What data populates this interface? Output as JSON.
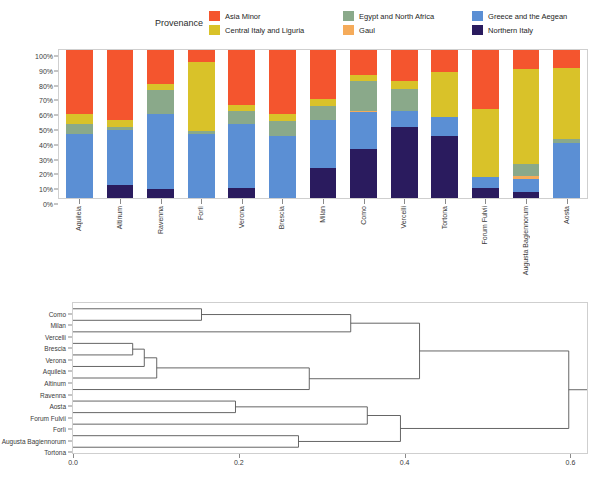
{
  "legend": {
    "title": "Provenance",
    "columns": [
      [
        {
          "label": "Asia Minor",
          "color": "#f4552e"
        },
        {
          "label": "Central Italy and Liguria",
          "color": "#d9c229"
        }
      ],
      [
        {
          "label": "Egypt and North Africa",
          "color": "#8aa98a"
        },
        {
          "label": "Gaul",
          "color": "#f5ab5a"
        }
      ],
      [
        {
          "label": "Greece and the Aegean",
          "color": "#5b8fd4"
        },
        {
          "label": "Northern Italy",
          "color": "#2a1b5e"
        }
      ]
    ]
  },
  "chart_data": [
    {
      "type": "bar",
      "subtype": "stacked-percentage",
      "title": "",
      "xlabel": "",
      "ylabel": "",
      "ylim": [
        0,
        100
      ],
      "ytick_labels": [
        "0%",
        "10%",
        "20%",
        "30%",
        "40%",
        "50%",
        "60%",
        "70%",
        "80%",
        "90%",
        "100%"
      ],
      "ytick_values": [
        0,
        10,
        20,
        30,
        40,
        50,
        60,
        70,
        80,
        90,
        100
      ],
      "grid": false,
      "legend_position": "top",
      "categories": [
        "Aquileia",
        "Altinum",
        "Ravenna",
        "Forlì",
        "Verona",
        "Brescia",
        "Milan",
        "Como",
        "Vercelli",
        "Tortona",
        "Forum Fulvii",
        "Augusta Bagiennorum",
        "Aosta"
      ],
      "series": [
        {
          "name": "Northern Italy",
          "color": "#2a1b5e",
          "values": [
            0,
            9,
            6,
            0,
            7,
            0,
            20,
            33,
            48,
            42,
            7,
            4,
            0
          ]
        },
        {
          "name": "Greece and the Aegean",
          "color": "#5b8fd4",
          "values": [
            43,
            37,
            51,
            43,
            43,
            42,
            33,
            25,
            11,
            13,
            7,
            9,
            37
          ]
        },
        {
          "name": "Gaul",
          "color": "#f5ab5a",
          "values": [
            0,
            0,
            0,
            0,
            0,
            0,
            0,
            1,
            0,
            0,
            0,
            2,
            0
          ]
        },
        {
          "name": "Egypt and North Africa",
          "color": "#8aa98a",
          "values": [
            7,
            2,
            16,
            2,
            9,
            10,
            9,
            20,
            15,
            0,
            0,
            8,
            3
          ]
        },
        {
          "name": "Central Italy and Liguria",
          "color": "#d9c229",
          "values": [
            7,
            5,
            4,
            47,
            4,
            5,
            5,
            4,
            5,
            30,
            46,
            64,
            48
          ]
        },
        {
          "name": "Asia Minor",
          "color": "#f4552e",
          "values": [
            43,
            47,
            23,
            8,
            37,
            43,
            33,
            17,
            21,
            15,
            40,
            13,
            12
          ]
        }
      ]
    },
    {
      "type": "dendrogram",
      "title": "",
      "xlabel": "",
      "ylabel": "",
      "xlim": [
        0.0,
        0.62
      ],
      "xtick_values": [
        0.0,
        0.2,
        0.4,
        0.6
      ],
      "xtick_labels": [
        "0.0",
        "0.2",
        "0.4",
        "0.6"
      ],
      "grid": false,
      "leaf_order": [
        "Como",
        "Milan",
        "Vercelli",
        "Brescia",
        "Verona",
        "Aquileia",
        "Altinum",
        "Ravenna",
        "Aosta",
        "Forum Fulvii",
        "Forlì",
        "Augusta Bagiennorum",
        "Tortona"
      ],
      "merges": [
        {
          "id": "m1",
          "left": {
            "leaf": "Como"
          },
          "right": {
            "leaf": "Milan"
          },
          "height": 0.155
        },
        {
          "id": "m2",
          "left": {
            "leaf": "Brescia"
          },
          "right": {
            "leaf": "Verona"
          },
          "height": 0.072
        },
        {
          "id": "m3",
          "left": {
            "node": "m2"
          },
          "right": {
            "leaf": "Aquileia"
          },
          "height": 0.086
        },
        {
          "id": "m4",
          "left": {
            "node": "m3"
          },
          "right": {
            "leaf": "Altinum"
          },
          "height": 0.101
        },
        {
          "id": "m5",
          "left": {
            "node": "m4"
          },
          "right": {
            "leaf": "Ravenna"
          },
          "height": 0.285
        },
        {
          "id": "m6",
          "left": {
            "node": "m1"
          },
          "right": {
            "leaf": "Vercelli"
          },
          "height": 0.335
        },
        {
          "id": "m7",
          "left": {
            "node": "m6"
          },
          "right": {
            "node": "m5"
          },
          "height": 0.418
        },
        {
          "id": "m8",
          "left": {
            "leaf": "Aosta"
          },
          "right": {
            "leaf": "Forum Fulvii"
          },
          "height": 0.196
        },
        {
          "id": "m9",
          "left": {
            "node": "m8"
          },
          "right": {
            "leaf": "Forlì"
          },
          "height": 0.355
        },
        {
          "id": "m10",
          "left": {
            "leaf": "Augusta Bagiennorum"
          },
          "right": {
            "leaf": "Tortona"
          },
          "height": 0.272
        },
        {
          "id": "m11",
          "left": {
            "node": "m9"
          },
          "right": {
            "node": "m10"
          },
          "height": 0.395
        },
        {
          "id": "m12",
          "left": {
            "node": "m7"
          },
          "right": {
            "node": "m11"
          },
          "height": 0.598
        }
      ],
      "line_color": "#555555"
    }
  ]
}
